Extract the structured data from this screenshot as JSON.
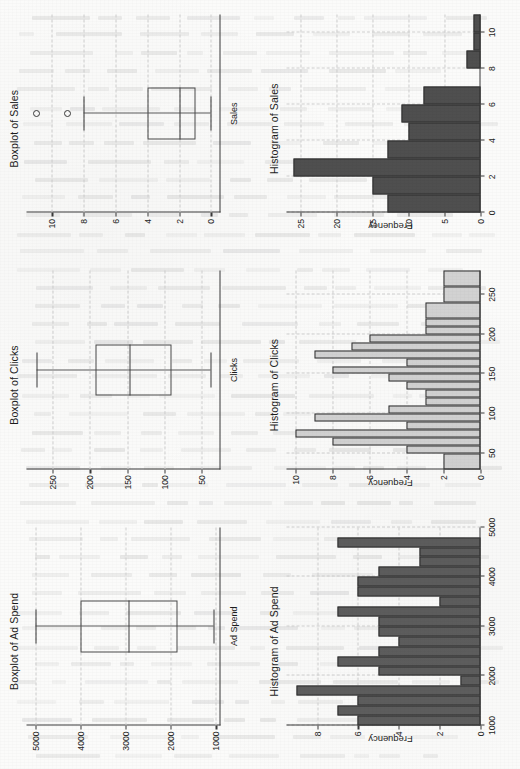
{
  "figure": {
    "layout": "2 rows x 3 columns, rotated 90 degrees counter-clockwise",
    "orientation": "rotated-ccw"
  },
  "panels": [
    {
      "key": "boxplot_ad_spend",
      "title": "Boxplot of Ad Spend",
      "group_label": "Ad Spend"
    },
    {
      "key": "boxplot_clicks",
      "title": "Boxplot of Clicks",
      "group_label": "Clicks"
    },
    {
      "key": "boxplot_sales",
      "title": "Boxplot of Sales",
      "group_label": "Sales"
    },
    {
      "key": "hist_ad_spend",
      "title": "Histogram of Ad Spend",
      "ylabel": "Frequency"
    },
    {
      "key": "hist_clicks",
      "title": "Histogram of Clicks",
      "ylabel": "Frequency"
    },
    {
      "key": "hist_sales",
      "title": "Histogram of Sales",
      "ylabel": "Frequency"
    }
  ],
  "chart_data": [
    {
      "type": "box",
      "key": "boxplot_ad_spend",
      "title": "Boxplot of Ad Spend",
      "xlabel": "Ad Spend",
      "ylabel": "",
      "categories": [
        "Ad Spend"
      ],
      "ylim": [
        900,
        5200
      ],
      "ticks": [
        1000,
        2000,
        3000,
        4000,
        5000
      ],
      "tick_labels": [
        "1000",
        "2000",
        "3000",
        "4000",
        "5000"
      ],
      "grid": true,
      "box": {
        "min": 1050,
        "q1": 1850,
        "median": 2950,
        "q3": 4000,
        "max": 5000,
        "outliers": []
      }
    },
    {
      "type": "box",
      "key": "boxplot_clicks",
      "title": "Boxplot of Clicks",
      "xlabel": "Clicks",
      "ylabel": "",
      "categories": [
        "Clicks"
      ],
      "ylim": [
        25,
        285
      ],
      "ticks": [
        50,
        100,
        150,
        200,
        250
      ],
      "tick_labels": [
        "50",
        "100",
        "150",
        "200",
        "250"
      ],
      "grid": true,
      "box": {
        "min": 38,
        "q1": 90,
        "median": 147,
        "q3": 192,
        "max": 272,
        "outliers": []
      }
    },
    {
      "type": "box",
      "key": "boxplot_sales",
      "title": "Boxplot of Sales",
      "xlabel": "Sales",
      "ylabel": "",
      "categories": [
        "Sales"
      ],
      "ylim": [
        -0.6,
        11.6
      ],
      "ticks": [
        0,
        2,
        4,
        6,
        8,
        10
      ],
      "tick_labels": [
        "0",
        "2",
        "4",
        "6",
        "8",
        "10"
      ],
      "grid": true,
      "box": {
        "min": 0,
        "q1": 1,
        "median": 2,
        "q3": 4,
        "max": 8,
        "outliers": [
          9,
          11
        ]
      }
    },
    {
      "type": "bar",
      "key": "hist_ad_spend",
      "title": "Histogram of Ad Spend",
      "xlabel": "",
      "ylabel": "Frequency",
      "bar_color": "#5e5e5e",
      "bin_edges": [
        1000,
        1200,
        1400,
        1600,
        1800,
        2000,
        2200,
        2400,
        2600,
        2800,
        3000,
        3200,
        3400,
        3600,
        3800,
        4000,
        4200,
        4400,
        4600,
        4800,
        5000
      ],
      "values": [
        6,
        7,
        6,
        9,
        1,
        5,
        7,
        5,
        4,
        5,
        5,
        7,
        2,
        6,
        6,
        5,
        3,
        3,
        7,
        0
      ],
      "xlim": [
        1000,
        5000
      ],
      "ylim": [
        0,
        9.5
      ],
      "xticks": [
        1000,
        2000,
        3000,
        4000,
        5000
      ],
      "xtick_labels": [
        "1000",
        "2000",
        "3000",
        "4000",
        "5000"
      ],
      "yticks": [
        0,
        2,
        4,
        6,
        8
      ],
      "ytick_labels": [
        "0",
        "2",
        "4",
        "6",
        "8"
      ],
      "grid": true
    },
    {
      "type": "bar",
      "key": "hist_clicks",
      "title": "Histogram of Clicks",
      "xlabel": "",
      "ylabel": "Frequency",
      "bar_color": "#d2d2d2",
      "bin_edges": [
        30,
        50,
        60,
        70,
        80,
        90,
        100,
        110,
        120,
        130,
        140,
        150,
        160,
        170,
        180,
        190,
        200,
        210,
        220,
        240,
        260,
        280
      ],
      "values": [
        2,
        4,
        8,
        10,
        4,
        9,
        5,
        3,
        3,
        4,
        5,
        8,
        4,
        9,
        7,
        6,
        3,
        3,
        3,
        2,
        2
      ],
      "xlim": [
        30,
        280
      ],
      "ylim": [
        0,
        10.5
      ],
      "xticks": [
        50,
        100,
        150,
        200,
        250
      ],
      "xtick_labels": [
        "50",
        "100",
        "150",
        "200",
        "250"
      ],
      "yticks": [
        0,
        2,
        4,
        6,
        8,
        10
      ],
      "ytick_labels": [
        "0",
        "2",
        "4",
        "6",
        "8",
        "10"
      ],
      "grid": true
    },
    {
      "type": "bar",
      "key": "hist_sales",
      "title": "Histogram of Sales",
      "xlabel": "",
      "ylabel": "Frequency",
      "bar_color": "#4f4f4f",
      "bin_edges": [
        0,
        1,
        2,
        3,
        4,
        5,
        6,
        7,
        8,
        9,
        10,
        11
      ],
      "values": [
        13,
        15,
        26,
        13,
        10,
        11,
        8,
        0,
        2,
        1,
        1
      ],
      "xlim": [
        0,
        11
      ],
      "ylim": [
        0,
        27
      ],
      "xticks": [
        0,
        2,
        4,
        6,
        8,
        10
      ],
      "xtick_labels": [
        "0",
        "2",
        "4",
        "6",
        "8",
        "10"
      ],
      "yticks": [
        0,
        5,
        10,
        15,
        20,
        25
      ],
      "ytick_labels": [
        "0",
        "5",
        "10",
        "15",
        "20",
        "25"
      ],
      "grid": true
    }
  ]
}
